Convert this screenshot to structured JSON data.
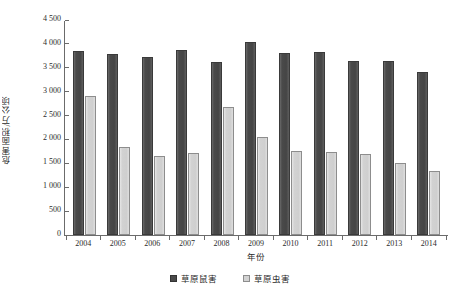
{
  "chart_data": {
    "type": "bar",
    "title": "",
    "xlabel": "年份",
    "ylabel": "危害面积/万公顷",
    "categories": [
      "2004",
      "2005",
      "2006",
      "2007",
      "2008",
      "2009",
      "2010",
      "2011",
      "2012",
      "2013",
      "2014"
    ],
    "series": [
      {
        "name": "草原鼠害",
        "color": "#4a4a4a",
        "values": [
          3850,
          3780,
          3730,
          3870,
          3620,
          4050,
          3820,
          3830,
          3650,
          3650,
          3420
        ]
      },
      {
        "name": "草原虫害",
        "color": "#d2d2d2",
        "values": [
          2900,
          1840,
          1650,
          1710,
          2670,
          2050,
          1760,
          1730,
          1690,
          1500,
          1340
        ]
      }
    ],
    "ylim": [
      0,
      4500
    ],
    "ytick_values": [
      0,
      500,
      1000,
      1500,
      2000,
      2500,
      3000,
      3500,
      4000,
      4500
    ],
    "ytick_labels": [
      "0",
      "500",
      "1 000",
      "1 500",
      "2 000",
      "2 500",
      "3 000",
      "3 500",
      "4 000",
      "4 500"
    ],
    "grid": false,
    "legend_position": "bottom-center"
  }
}
